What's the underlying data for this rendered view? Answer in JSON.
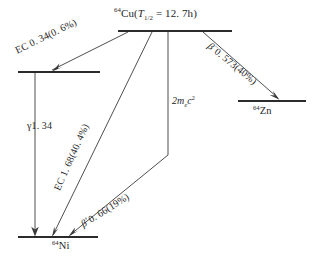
{
  "figure": {
    "background_color": "#ffffff",
    "line_color": "#2b2b2b",
    "arrow_color": "#3a3a3a"
  },
  "levels": {
    "parent": {
      "name": "cu64-level",
      "label_mass": "64",
      "label_symbol": "Cu(",
      "halflife_t": "T",
      "halflife_sub": "1/2",
      "halflife_value": " = 12. 7h)",
      "full_label": "⁶⁴Cu(T₁/₂ = 12. 7h)"
    },
    "ni_excited": {
      "name": "ni64-excited-level",
      "full_label": ""
    },
    "ni_ground": {
      "name": "ni64-ground-level",
      "mass": "64",
      "symbol": "Ni",
      "full_label": "⁶⁴Ni"
    },
    "zn_ground": {
      "name": "zn64-ground-level",
      "mass": "64",
      "symbol": "Zn",
      "full_label": "⁶⁴Zn"
    }
  },
  "transitions": [
    {
      "id": "ec-034",
      "name": "ec-0-34-transition",
      "mode": "EC",
      "text": "EC 0. 34(0. 6%)",
      "energy_mev": 0.34,
      "intensity_percent": 0.6,
      "from": "cu64",
      "to": "ni64-excited"
    },
    {
      "id": "beta-minus",
      "name": "beta-minus-transition",
      "mode": "beta-minus",
      "symbol": "β",
      "charge": "−",
      "text": "0. 573(40%)",
      "energy_mev": 0.573,
      "intensity_percent": 40,
      "from": "cu64",
      "to": "zn64"
    },
    {
      "id": "ec-168",
      "name": "ec-1-68-transition",
      "mode": "EC",
      "text": "EC 1. 68(40. 4%)",
      "energy_mev": 1.68,
      "intensity_percent": 40.4,
      "from": "cu64",
      "to": "ni64-ground"
    },
    {
      "id": "beta-plus",
      "name": "beta-plus-transition",
      "mode": "beta-plus",
      "symbol": "β",
      "charge": "+",
      "text": "0. 66(19%)",
      "energy_mev": 0.66,
      "intensity_percent": 19,
      "from": "cu64",
      "to": "ni64-ground"
    },
    {
      "id": "gamma",
      "name": "gamma-transition",
      "mode": "gamma",
      "symbol": "γ",
      "text": "1. 34",
      "energy_mev": 1.34,
      "from": "ni64-excited",
      "to": "ni64-ground"
    },
    {
      "id": "annihilation",
      "name": "annihilation-energy-marker",
      "mode": "rest-mass",
      "coef": "2",
      "m_sym": "m",
      "m_sub": "e",
      "c_sym": "c",
      "c_sup": "2",
      "text": "2mₑc²"
    }
  ]
}
